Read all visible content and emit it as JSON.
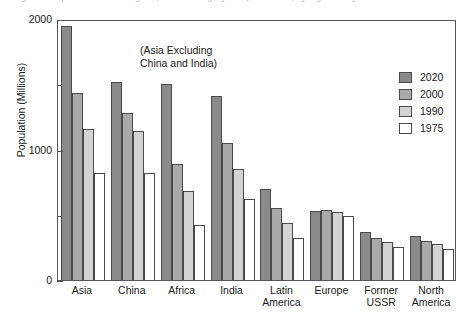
{
  "caption": {
    "text": "Figure 1. Population of world regions, 1975–2020 (projected), in millions, by region and year."
  },
  "chart_data": {
    "type": "bar",
    "title": "",
    "xlabel": "",
    "ylabel": "Population (Millions)",
    "ylim": [
      0,
      2000
    ],
    "yticks": [
      0,
      1000,
      2000
    ],
    "ytick_labels": [
      "0",
      "1000",
      "2000"
    ],
    "yminor_ticks": [
      500,
      1500
    ],
    "grid": false,
    "legend_position": "top-right",
    "categories": [
      "Asia",
      "China",
      "Africa",
      "India",
      "Latin\nAmerica",
      "Europe",
      "Former\nUSSR",
      "North\nAmerica"
    ],
    "series": [
      {
        "name": "2020",
        "color": "#8a8a8a",
        "values": [
          1950,
          1520,
          1500,
          1410,
          700,
          530,
          370,
          340
        ]
      },
      {
        "name": "2000",
        "color": "#a9a9a9",
        "values": [
          1430,
          1280,
          890,
          1050,
          550,
          535,
          320,
          300
        ]
      },
      {
        "name": "1990",
        "color": "#d3d3d3",
        "values": [
          1160,
          1140,
          680,
          850,
          440,
          525,
          290,
          275
        ]
      },
      {
        "name": "1975",
        "color": "#ffffff",
        "values": [
          820,
          820,
          420,
          620,
          320,
          490,
          255,
          240
        ]
      }
    ],
    "annotations": [
      {
        "text": "(Asia Excluding\n China and India)"
      }
    ]
  }
}
